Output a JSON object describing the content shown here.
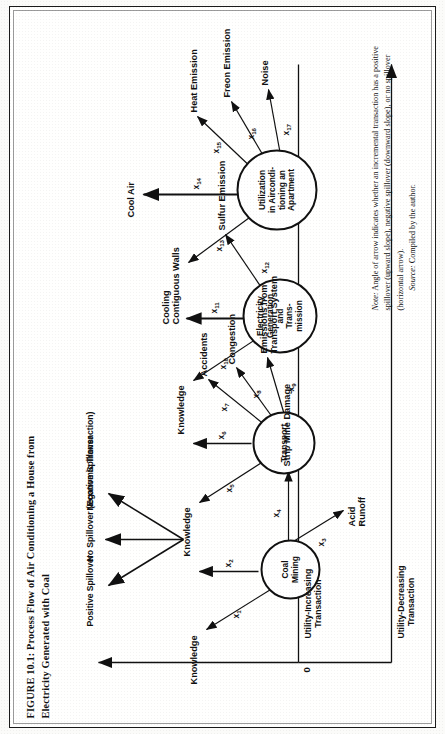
{
  "figure": {
    "title": "FIGURE 10.1:  Process Flow of Air Conditioning a House from Electricity Generated with Coal",
    "note_label": "Note:",
    "note_text": " Angle of arrow indicates whether an incremental transaction has a positive spillover (upward slope), negative spillover (downward slope), or no spillover (horizontal arrow).",
    "source_label": "Source:",
    "source_text": " Compiled by the author."
  },
  "axes": {
    "origin": "0",
    "up_label": "Utility-Increasing\nTransaction",
    "down_label": "Utility-Decreasing\nTransaction"
  },
  "legend": {
    "items": [
      {
        "key": "positive",
        "label": "Positive Spillover"
      },
      {
        "key": "none",
        "label": "No Spillover (Economic Transaction)"
      },
      {
        "key": "negative",
        "label": "Negative Spillover"
      }
    ]
  },
  "nodes": [
    {
      "id": "coal-mining",
      "label": "Coal\nMining"
    },
    {
      "id": "transport",
      "label": "Transport"
    },
    {
      "id": "electricity-generation",
      "label": "Electricity\nGeneration\nand\nTrans-\nmission"
    },
    {
      "id": "utilization",
      "label": "Utilization\nin Aircondi-\ntioning  an\nApartment"
    }
  ],
  "flows": [
    {
      "var": "x",
      "sub": "1",
      "label": "Knowledge",
      "from": "coal-mining",
      "slope": "up"
    },
    {
      "var": "x",
      "sub": "2",
      "label": "",
      "from": "coal-mining",
      "slope": "up",
      "to": "transport"
    },
    {
      "var": "x",
      "sub": "3",
      "label": "Acid\nRunoff",
      "from": "coal-mining",
      "slope": "down"
    },
    {
      "var": "x",
      "sub": "4",
      "label": "Strip Mine Damage",
      "from": "coal-mining",
      "slope": "flat"
    },
    {
      "var": "x",
      "sub": "5",
      "label": "Knowledge",
      "from": "transport",
      "slope": "up"
    },
    {
      "var": "x",
      "sub": "6",
      "label": "",
      "from": "transport",
      "slope": "up",
      "to": "electricity-generation"
    },
    {
      "var": "x",
      "sub": "7",
      "label": "Accidents",
      "from": "transport",
      "slope": "down"
    },
    {
      "var": "x",
      "sub": "8",
      "label": "Congestion",
      "from": "transport",
      "slope": "down"
    },
    {
      "var": "x",
      "sub": "9",
      "label": "Emissions from\nTransport System",
      "from": "transport",
      "slope": "flat"
    },
    {
      "var": "x",
      "sub": "10",
      "label": "Knowledge",
      "from": "electricity-generation",
      "slope": "up"
    },
    {
      "var": "x",
      "sub": "11",
      "label": "",
      "from": "electricity-generation",
      "slope": "up",
      "to": "utilization"
    },
    {
      "var": "x",
      "sub": "12",
      "label": "Sulfur Emission",
      "from": "electricity-generation",
      "slope": "down"
    },
    {
      "var": "x",
      "sub": "13",
      "label": "Cooling\nContiguous Walls",
      "from": "utilization",
      "slope": "up"
    },
    {
      "var": "x",
      "sub": "14",
      "label": "Cool Air",
      "from": "utilization",
      "slope": "up"
    },
    {
      "var": "x",
      "sub": "15",
      "label": "Heat Emission",
      "from": "utilization",
      "slope": "down"
    },
    {
      "var": "x",
      "sub": "16",
      "label": "Freon Emission",
      "from": "utilization",
      "slope": "down"
    },
    {
      "var": "x",
      "sub": "17",
      "label": "Noise",
      "from": "utilization",
      "slope": "flat"
    }
  ],
  "colors": {
    "ink": "#111111",
    "paper": "#fffffe",
    "frame": "#1a1a1a"
  }
}
